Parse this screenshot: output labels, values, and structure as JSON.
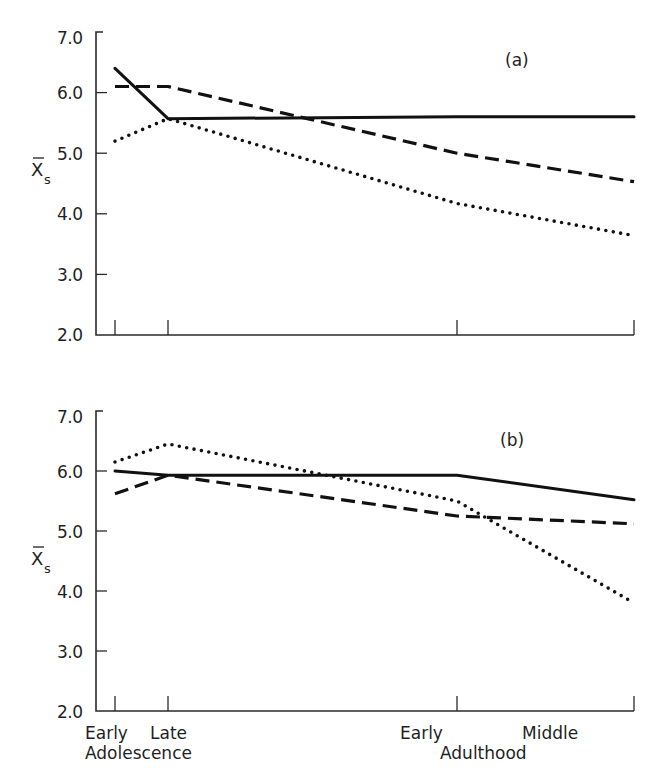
{
  "chart_data": [
    {
      "type": "line",
      "panel": "(a)",
      "title": "(a)",
      "xlabel": "",
      "ylabel": "X̄s",
      "ylim": [
        2.0,
        7.0
      ],
      "yticks": [
        "2.0",
        "3.0",
        "4.0",
        "5.0",
        "6.0",
        "7.0"
      ],
      "categories": [
        "Early Adolescence",
        "Late Adolescence",
        "Early Adulthood",
        "Middle Adulthood"
      ],
      "grid": false,
      "series": [
        {
          "name": "solid",
          "style": "solid",
          "values": [
            6.4,
            5.57,
            5.6,
            5.6
          ]
        },
        {
          "name": "dashed",
          "style": "dashed",
          "values": [
            6.1,
            6.1,
            5.0,
            4.53
          ]
        },
        {
          "name": "dotted",
          "style": "dotted",
          "values": [
            5.2,
            5.57,
            4.17,
            3.64
          ]
        }
      ]
    },
    {
      "type": "line",
      "panel": "(b)",
      "title": "(b)",
      "xlabel": "",
      "ylabel": "X̄s",
      "ylim": [
        2.0,
        7.0
      ],
      "yticks": [
        "2.0",
        "3.0",
        "4.0",
        "5.0",
        "6.0",
        "7.0"
      ],
      "categories": [
        "Early Adolescence",
        "Late Adolescence",
        "Early Adulthood",
        "Middle Adulthood"
      ],
      "grid": false,
      "series": [
        {
          "name": "solid",
          "style": "solid",
          "values": [
            6.0,
            5.93,
            5.93,
            5.52
          ]
        },
        {
          "name": "dashed",
          "style": "dashed",
          "values": [
            5.62,
            5.93,
            5.25,
            5.12
          ]
        },
        {
          "name": "dotted",
          "style": "dotted",
          "values": [
            6.15,
            6.45,
            5.5,
            3.8
          ]
        }
      ]
    }
  ],
  "figure": {
    "panel_a_label": "(a)",
    "panel_b_label": "(b)",
    "ylabel_main": "X",
    "ylabel_sub": "s",
    "x_tick_labels": {
      "early_adolescence": "Early",
      "late_adolescence": "Late",
      "adolescence_group": "Adolescence",
      "early_adulthood": "Early",
      "middle_adulthood": "Middle",
      "adulthood_group": "Adulthood"
    }
  }
}
